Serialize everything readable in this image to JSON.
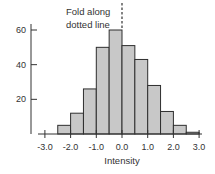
{
  "chart_data": {
    "type": "bar",
    "subtype": "histogram",
    "title": "",
    "xlabel": "Intensity",
    "ylabel": "",
    "bin_edges": [
      -2.5,
      -2.0,
      -1.5,
      -1.0,
      -0.5,
      0.0,
      0.5,
      1.0,
      1.5,
      2.0,
      2.5,
      3.0
    ],
    "categories": [
      "-2.5 to -2.0",
      "-2.0 to -1.5",
      "-1.5 to -1.0",
      "-1.0 to -0.5",
      "-0.5 to 0.0",
      "0.0 to 0.5",
      "0.5 to 1.0",
      "1.0 to 1.5",
      "1.5 to 2.0",
      "2.0 to 2.5",
      "2.5 to 3.0"
    ],
    "values": [
      5,
      12,
      26,
      50,
      60,
      51,
      43,
      28,
      13,
      5,
      1
    ],
    "xlim": [
      -3.0,
      3.0
    ],
    "ylim": [
      0,
      60
    ],
    "x_ticks": [
      "-3.0",
      "-2.0",
      "-1.0",
      "0.0",
      "1.0",
      "2.0",
      "3.0"
    ],
    "x_tick_values": [
      -3,
      -2,
      -1,
      0,
      1,
      2,
      3
    ],
    "y_ticks": [
      "20",
      "40",
      "60"
    ],
    "y_tick_values": [
      20,
      40,
      60
    ],
    "grid": false,
    "legend": null,
    "annotations": [
      {
        "text_line1": "Fold along",
        "text_line2": "dotted line",
        "x": 0.0,
        "style": "dashed vertical line"
      }
    ]
  },
  "colors": {
    "bar_fill": "#c8c8c8",
    "bar_stroke": "#2e2e2e",
    "axis": "#333333",
    "text": "#333333"
  },
  "annotation": {
    "line1": "Fold along",
    "line2": "dotted line"
  },
  "axis": {
    "xlabel": "Intensity"
  }
}
